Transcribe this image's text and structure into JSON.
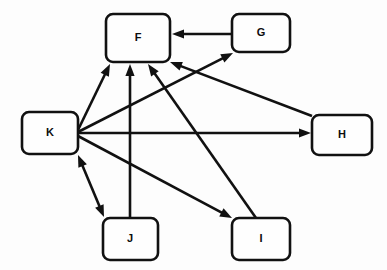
{
  "diagram": {
    "type": "node-link-diagram",
    "background_color": "#fdfdfd",
    "stroke_color": "#111111",
    "node_fill_color": "#fefefe",
    "canvas": {
      "width": 387,
      "height": 270
    },
    "nodes": [
      {
        "id": "F",
        "label": "F",
        "x": 106,
        "y": 14,
        "w": 64,
        "h": 48,
        "cx": 138,
        "cy": 38
      },
      {
        "id": "G",
        "label": "G",
        "x": 232,
        "y": 14,
        "w": 58,
        "h": 38,
        "cx": 261,
        "cy": 33
      },
      {
        "id": "K",
        "label": "K",
        "x": 22,
        "y": 112,
        "w": 56,
        "h": 42,
        "cx": 50,
        "cy": 133
      },
      {
        "id": "H",
        "label": "H",
        "x": 312,
        "y": 115,
        "w": 60,
        "h": 40,
        "cx": 342,
        "cy": 135
      },
      {
        "id": "J",
        "label": "J",
        "x": 103,
        "y": 218,
        "w": 55,
        "h": 42,
        "cx": 130,
        "cy": 239
      },
      {
        "id": "I",
        "label": "I",
        "x": 232,
        "y": 218,
        "w": 58,
        "h": 42,
        "cx": 261,
        "cy": 239
      }
    ],
    "edges": [
      {
        "id": "g-to-f",
        "from": "G",
        "to": "F",
        "direction": "one-way",
        "x1": 232,
        "y1": 34,
        "x2": 172,
        "y2": 34
      },
      {
        "id": "k-to-f",
        "from": "K",
        "to": "F",
        "direction": "one-way",
        "x1": 78,
        "y1": 130,
        "x2": 110,
        "y2": 64
      },
      {
        "id": "k-to-g",
        "from": "K",
        "to": "G",
        "direction": "one-way",
        "x1": 78,
        "y1": 132,
        "x2": 233,
        "y2": 53
      },
      {
        "id": "k-to-h",
        "from": "K",
        "to": "H",
        "direction": "one-way",
        "x1": 78,
        "y1": 133,
        "x2": 311,
        "y2": 133
      },
      {
        "id": "k-to-i",
        "from": "K",
        "to": "I",
        "direction": "one-way",
        "x1": 78,
        "y1": 136,
        "x2": 232,
        "y2": 218
      },
      {
        "id": "k-to-j",
        "from": "K",
        "to": "J",
        "direction": "bidirectional",
        "x1": 78,
        "y1": 155,
        "x2": 104,
        "y2": 217
      },
      {
        "id": "j-to-f",
        "from": "J",
        "to": "F",
        "direction": "one-way",
        "x1": 130,
        "y1": 218,
        "x2": 130,
        "y2": 64
      },
      {
        "id": "i-to-f",
        "from": "I",
        "to": "F",
        "direction": "one-way",
        "x1": 256,
        "y1": 218,
        "x2": 148,
        "y2": 64
      },
      {
        "id": "h-to-f",
        "from": "H",
        "to": "F",
        "direction": "one-way",
        "x1": 312,
        "y1": 116,
        "x2": 170,
        "y2": 62
      }
    ]
  }
}
